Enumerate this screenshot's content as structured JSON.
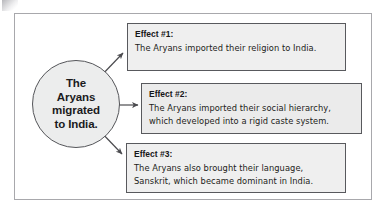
{
  "diagram": {
    "type": "cause-and-effect-map",
    "cause": {
      "label": "The\nAryans\nmigrated\nto India.",
      "shape": "circle",
      "fill_color": "#eceded",
      "border_color": "#55565a"
    },
    "effects": [
      {
        "heading": "Effect #1:",
        "body": "The Aryans imported their religion to India.",
        "fill_color": "#efefef",
        "border_color": "#58595d",
        "arrow": "diagonal-up-right"
      },
      {
        "heading": "Effect #2:",
        "body": "The Aryans imported their social hierarchy,\nwhich developed into a rigid caste system.",
        "fill_color": "#ebebeb",
        "border_color": "#58595d",
        "arrow": "horizontal-right"
      },
      {
        "heading": "Effect #3:",
        "body": "The Aryans also brought their language,\nSanskrit, which became dominant in India.",
        "fill_color": "#efefef",
        "border_color": "#58595d",
        "arrow": "diagonal-down-right"
      }
    ],
    "frame": {
      "border_color": "#a8a8ac",
      "background_color": "#ffffff"
    },
    "arrow_color": "#4a4a4e"
  }
}
